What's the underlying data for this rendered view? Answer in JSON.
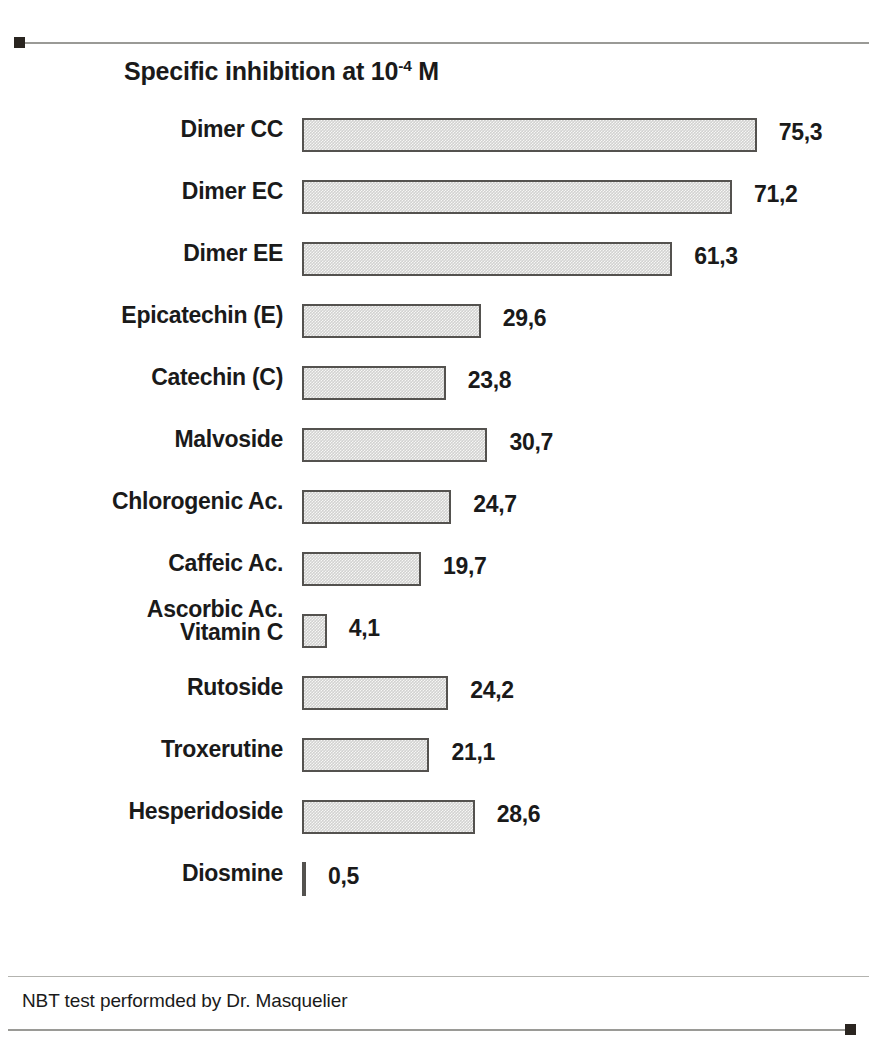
{
  "chart_data": {
    "type": "bar",
    "orientation": "horizontal",
    "title": "Specific inhibition at 10-4 M",
    "title_prefix": "Specific inhibition at 10",
    "title_exponent": "-4",
    "title_suffix": " M",
    "xlabel": "",
    "ylabel": "",
    "xlim": [
      0,
      80
    ],
    "grid": false,
    "legend": "none",
    "value_decimal_separator": ",",
    "categories": [
      "Dimer CC",
      "Dimer EC",
      "Dimer EE",
      "Epicatechin (E)",
      "Catechin (C)",
      "Malvoside",
      "Chlorogenic Ac.",
      "Caffeic Ac.",
      "Ascorbic Ac.\nVitamin C",
      "Rutoside",
      "Troxerutine",
      "Hesperidoside",
      "Diosmine"
    ],
    "values": [
      75.3,
      71.2,
      61.3,
      29.6,
      23.8,
      30.7,
      24.7,
      19.7,
      4.1,
      24.2,
      21.1,
      28.6,
      0.5
    ],
    "value_labels": [
      "75,3",
      "71,2",
      "61,3",
      "29,6",
      "23,8",
      "30,7",
      "24,7",
      "19,7",
      "4,1",
      "24,2",
      "21,1",
      "28,6",
      "0,5"
    ],
    "annotation": "NBT test performded by Dr. Masquelier"
  },
  "rows": [
    {
      "label": "Dimer CC",
      "value_label": "75,3",
      "value": 75.3,
      "two_line": false
    },
    {
      "label": "Dimer EC",
      "value_label": "71,2",
      "value": 71.2,
      "two_line": false
    },
    {
      "label": "Dimer EE",
      "value_label": "61,3",
      "value": 61.3,
      "two_line": false
    },
    {
      "label": "Epicatechin (E)",
      "value_label": "29,6",
      "value": 29.6,
      "two_line": false
    },
    {
      "label": "Catechin (C)",
      "value_label": "23,8",
      "value": 23.8,
      "two_line": false
    },
    {
      "label": "Malvoside",
      "value_label": "30,7",
      "value": 30.7,
      "two_line": false
    },
    {
      "label": "Chlorogenic Ac.",
      "value_label": "24,7",
      "value": 24.7,
      "two_line": false
    },
    {
      "label": "Caffeic Ac.",
      "value_label": "19,7",
      "value": 19.7,
      "two_line": false
    },
    {
      "label": "Ascorbic Ac.\nVitamin C",
      "value_label": "4,1",
      "value": 4.1,
      "two_line": true
    },
    {
      "label": "Rutoside",
      "value_label": "24,2",
      "value": 24.2,
      "two_line": false
    },
    {
      "label": "Troxerutine",
      "value_label": "21,1",
      "value": 21.1,
      "two_line": false
    },
    {
      "label": "Hesperidoside",
      "value_label": "28,6",
      "value": 28.6,
      "two_line": false
    },
    {
      "label": "Diosmine",
      "value_label": "0,5",
      "value": 0.5,
      "two_line": false
    }
  ],
  "footer": {
    "note": "NBT test performded by Dr. Masquelier"
  },
  "style": {
    "bar_fill": "#d2d2d0",
    "bar_border": "#54524f",
    "text": "#1a1a1a",
    "rule": "#9a9a96",
    "rule_cap": "#2a2520"
  }
}
